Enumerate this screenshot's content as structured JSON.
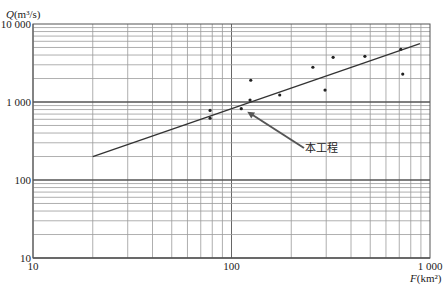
{
  "chart_data": {
    "type": "scatter",
    "title": "",
    "xlabel": "F(km²)",
    "ylabel": "Q(m³/s)",
    "xscale": "log",
    "yscale": "log",
    "xlim": [
      10,
      1000
    ],
    "ylim": [
      10,
      10000
    ],
    "grid": true,
    "x_ticks": [
      "10",
      "100",
      "1 000"
    ],
    "y_ticks": [
      "10",
      "100",
      "1 000",
      "10 000"
    ],
    "series": [
      {
        "name": "observed",
        "kind": "scatter",
        "points": [
          [
            78,
            620
          ],
          [
            78,
            780
          ],
          [
            112,
            820
          ],
          [
            124,
            1060
          ],
          [
            125,
            1900
          ],
          [
            175,
            1230
          ],
          [
            257,
            2790
          ],
          [
            296,
            1420
          ],
          [
            325,
            3740
          ],
          [
            470,
            3850
          ],
          [
            713,
            4730
          ],
          [
            729,
            2280
          ]
        ]
      },
      {
        "name": "fit-line",
        "kind": "line",
        "points": [
          [
            20,
            200
          ],
          [
            890,
            5600
          ]
        ]
      }
    ],
    "annotations": [
      {
        "text": "本工程",
        "target": [
          112,
          820
        ],
        "label_at": [
          300,
          140
        ]
      }
    ]
  },
  "labels": {
    "ylabel": "Q(m³/s)",
    "xlabel": "F(km²)",
    "annotation": "本工程"
  }
}
